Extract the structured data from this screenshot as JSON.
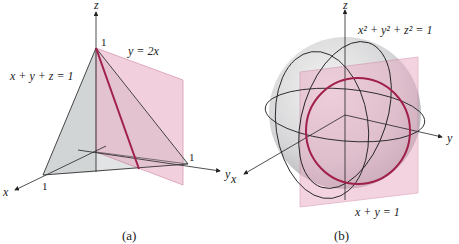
{
  "figure_a": {
    "caption": "(a)",
    "axis_x": "x",
    "axis_y": "y",
    "axis_z": "z",
    "tick_x": "1",
    "tick_y": "1",
    "tick_z": "1",
    "plane_label": "x + y + z = 1",
    "cut_plane_label": "y = 2x"
  },
  "figure_b": {
    "caption": "(b)",
    "axis_x": "x",
    "axis_y": "y",
    "axis_z": "z",
    "sphere_label": "x² + y² + z² = 1",
    "plane_label": "x + y = 1"
  },
  "colors": {
    "plane_fill": "#e8b4c8",
    "curve": "#a0204a",
    "tetra_fill": "#d8dadc",
    "sphere_fill": "#d4d4d6"
  }
}
